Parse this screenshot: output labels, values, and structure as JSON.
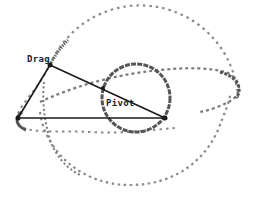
{
  "diagram": {
    "labels": {
      "drag": "Drag",
      "pivot": "Pivot"
    },
    "colors": {
      "line": "#1a1a1a",
      "trace_dark": "#555555",
      "trace_light": "#9a9a9a",
      "background": "#ffffff"
    },
    "points": {
      "drag": {
        "x": 50,
        "y": 65
      },
      "left_vertex": {
        "x": 18,
        "y": 118
      },
      "pivot_vertex": {
        "x": 165,
        "y": 118
      },
      "edge_point": {
        "x": 103,
        "y": 88
      }
    },
    "big_circle": {
      "cx": 140,
      "cy": 110,
      "r": 98
    },
    "small_circle": {
      "cx": 136,
      "cy": 98,
      "r": 34
    }
  }
}
